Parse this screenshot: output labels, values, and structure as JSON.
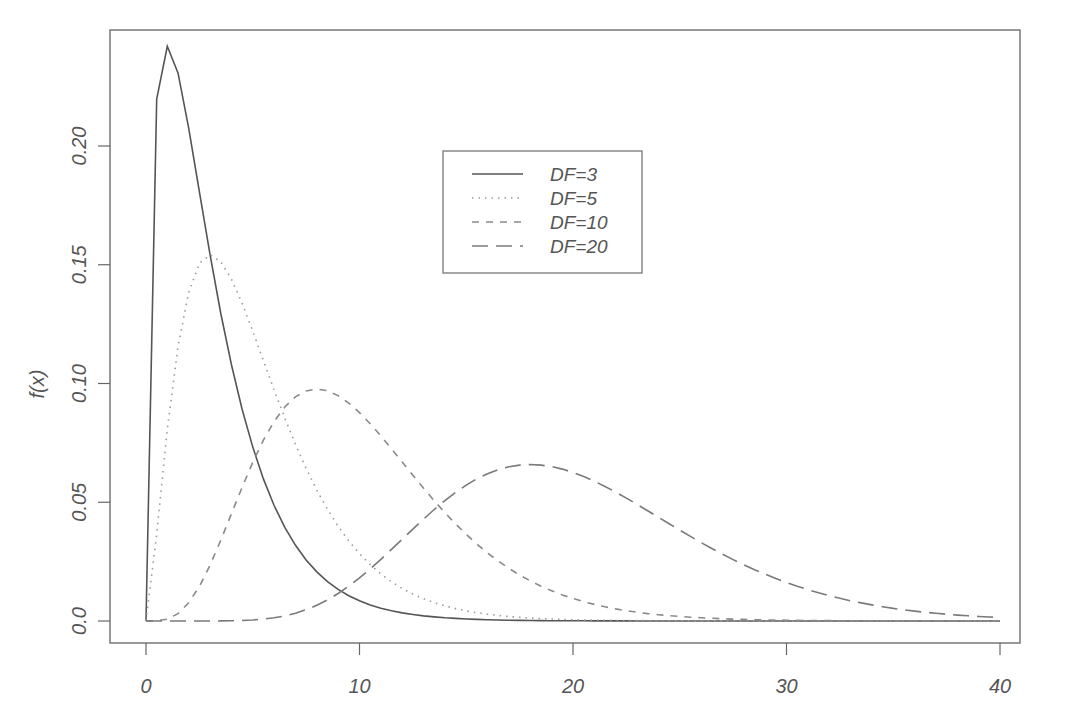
{
  "chart_data": {
    "type": "line",
    "title": "",
    "xlabel": "",
    "ylabel": "f(x)",
    "xlim": [
      0,
      40
    ],
    "ylim": [
      0,
      0.24
    ],
    "grid": false,
    "legend_position": "top-center",
    "x_ticks": [
      "0",
      "10",
      "20",
      "30",
      "40"
    ],
    "y_ticks": [
      "0.0",
      "0.05",
      "0.10",
      "0.15",
      "0.20"
    ],
    "series": [
      {
        "name": "DF=3",
        "df": 3,
        "line_style": "solid",
        "color": "#555555",
        "peak_x": 1,
        "peak_y": 0.242
      },
      {
        "name": "DF=5",
        "df": 5,
        "line_style": "dotted",
        "color": "#9a9a9a",
        "peak_x": 3,
        "peak_y": 0.154
      },
      {
        "name": "DF=10",
        "df": 10,
        "line_style": "dashed",
        "color": "#8a8a8a",
        "peak_x": 8,
        "peak_y": 0.0977
      },
      {
        "name": "DF=20",
        "df": 20,
        "line_style": "longdash",
        "color": "#7a7a7a",
        "peak_x": 18,
        "peak_y": 0.0665
      }
    ]
  },
  "legend": {
    "items": [
      {
        "label": "DF=3"
      },
      {
        "label": "DF=5"
      },
      {
        "label": "DF=10"
      },
      {
        "label": "DF=20"
      }
    ]
  },
  "axes": {
    "ylabel": "f(x)",
    "x_tick_labels": [
      "0",
      "10",
      "20",
      "30",
      "40"
    ],
    "y_tick_labels": [
      "0.0",
      "0.05",
      "0.10",
      "0.15",
      "0.20"
    ]
  }
}
